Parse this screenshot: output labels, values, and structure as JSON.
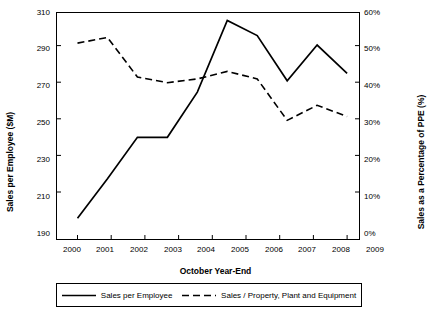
{
  "chart_data": {
    "type": "line",
    "title": "",
    "xlabel": "October Year-End",
    "ylabel": "Sales per Employee ($M)",
    "y2label": "Sales as a Percentage of PPE (%)",
    "categories": [
      "2000",
      "2001",
      "2002",
      "2003",
      "2004",
      "2005",
      "2006",
      "2007",
      "2008",
      "2009"
    ],
    "ylim": [
      190,
      310
    ],
    "yticks": [
      "190",
      "210",
      "230",
      "250",
      "270",
      "290",
      "310"
    ],
    "y2lim": [
      0,
      60
    ],
    "y2ticks": [
      "0%",
      "10%",
      "20%",
      "30%",
      "40%",
      "50%",
      "60%"
    ],
    "grid": false,
    "legend_position": "bottom",
    "series": [
      {
        "name": "Sales per Employee",
        "axis": "left",
        "style": "solid",
        "color": "#000000",
        "values": [
          201,
          222,
          244,
          244,
          268,
          306,
          298,
          274,
          293,
          278
        ]
      },
      {
        "name": "Sales / Property, Plant and Equipment",
        "axis": "right",
        "style": "dashed",
        "color": "#000000",
        "values": [
          52.0,
          53.5,
          43.0,
          41.5,
          42.5,
          44.5,
          42.5,
          31.5,
          35.5,
          32.5
        ]
      }
    ]
  },
  "axes": {
    "x_title": "October Year-End",
    "y_left_title": "Sales per Employee ($M)",
    "y_right_title": "Sales as a Percentage of PPE (%)"
  },
  "legend": {
    "items": [
      {
        "label": "Sales per Employee",
        "style": "solid"
      },
      {
        "label": "Sales / Property, Plant and Equipment",
        "style": "dashed"
      }
    ]
  }
}
